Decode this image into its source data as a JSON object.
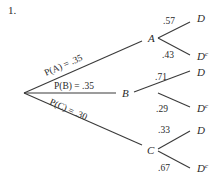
{
  "problem_number": "1.",
  "tree": {
    "root": {
      "x": 24,
      "y": 93
    },
    "level1": [
      {
        "id": "A",
        "label": "A",
        "prob_label": "P(A) = .35",
        "x": 152,
        "y": 38,
        "edge_end": {
          "x": 142,
          "y": 42
        },
        "branches": [
          {
            "label": ".57",
            "outcome": "D",
            "sup": ""
          },
          {
            "label": ".43",
            "outcome": "D",
            "sup": "c"
          }
        ]
      },
      {
        "id": "B",
        "label": "B",
        "prob_label": "P(B) = .35",
        "x": 152,
        "y": 93,
        "edge_end": {
          "x": 142,
          "y": 93
        },
        "branches": [
          {
            "label": ".71",
            "outcome": "D",
            "sup": ""
          },
          {
            "label": ".29",
            "outcome": "D",
            "sup": "c"
          }
        ]
      },
      {
        "id": "C",
        "label": "C",
        "prob_label": "P(C) = .30",
        "x": 152,
        "y": 150,
        "edge_end": {
          "x": 142,
          "y": 145
        },
        "branches": [
          {
            "label": ".33",
            "outcome": "D",
            "sup": ""
          },
          {
            "label": ".67",
            "outcome": "D",
            "sup": "c"
          }
        ]
      }
    ]
  }
}
